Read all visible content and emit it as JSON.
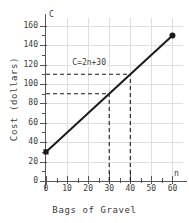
{
  "chart_data": {
    "type": "line",
    "title": "",
    "xlabel": "Bags of Gravel",
    "ylabel": "Cost (dollars)",
    "x_axis_symbol": "n",
    "y_axis_symbol": "C",
    "xlim": [
      0,
      65
    ],
    "ylim": [
      0,
      168
    ],
    "x_tick_labels": [
      "0",
      "10",
      "20",
      "30",
      "40",
      "50",
      "60"
    ],
    "x_tick_values": [
      0,
      10,
      20,
      30,
      40,
      50,
      60
    ],
    "x_minor_tick_step": 5,
    "y_tick_labels": [
      "0",
      "20",
      "40",
      "60",
      "80",
      "100",
      "120",
      "140",
      "160"
    ],
    "y_tick_values": [
      0,
      20,
      40,
      60,
      80,
      100,
      120,
      140,
      160
    ],
    "y_minor_tick_step": 10,
    "grid": true,
    "grid_step_x": 10,
    "grid_step_y": 20,
    "legend": "none",
    "equation": "C=2n+30",
    "slope": 2,
    "intercept": 30,
    "series": [
      {
        "name": "C=2n+30",
        "points": [
          [
            0,
            30
          ],
          [
            60,
            150
          ]
        ],
        "color": "#1a1a1a",
        "start_marker": "square",
        "end_marker": "circle"
      }
    ],
    "annotations": [
      {
        "text": "C=2n+30",
        "x": 12,
        "y": 122
      }
    ],
    "guide_lines": [
      {
        "type": "horizontal",
        "y": 90,
        "from_x": 0,
        "to_x": 30,
        "style": "dashed"
      },
      {
        "type": "vertical",
        "x": 30,
        "from_y": 0,
        "to_y": 90,
        "style": "dashed"
      },
      {
        "type": "horizontal",
        "y": 110,
        "from_x": 0,
        "to_x": 40,
        "style": "dashed"
      },
      {
        "type": "vertical",
        "x": 40,
        "from_y": 0,
        "to_y": 110,
        "style": "dashed"
      }
    ],
    "colors": {
      "line": "#1a1a1a",
      "grid": "#dedede",
      "axis": "#555555",
      "text": "#3a3a3a",
      "dashed": "#1a1a1a"
    }
  }
}
